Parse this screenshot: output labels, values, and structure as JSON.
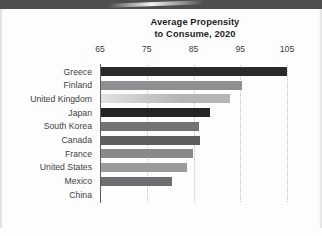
{
  "chart_data": {
    "type": "bar",
    "orientation": "horizontal",
    "title": "Average Propensity to Consume, 2020",
    "title_line1": "Average Propensity",
    "title_line2": "to Consume, 2020",
    "xlabel": "",
    "ylabel": "",
    "xlim": [
      65,
      105
    ],
    "xticks": [
      65,
      75,
      85,
      95,
      105
    ],
    "xtick_labels": [
      "65",
      "75",
      "85",
      "95",
      "105"
    ],
    "grid": "dotted vertical gridlines at each x tick",
    "legend": "none",
    "categories": [
      "Greece",
      "Finland",
      "United Kingdom",
      "Japan",
      "South Korea",
      "Canada",
      "France",
      "United States",
      "Mexico",
      "China"
    ],
    "values": [
      105.0,
      95.3,
      92.8,
      88.5,
      86.1,
      86.3,
      84.9,
      83.7,
      80.3,
      65.3
    ],
    "bar_colors": [
      "#2a2a2c",
      "#8f8f91",
      "#b4b4b6",
      "#242426",
      "#737375",
      "#5f5f61",
      "#8a8a8c",
      "#9a9a9c",
      "#6e6e70",
      "#59595b"
    ]
  },
  "page": {
    "background": "#fdfdfd",
    "top_band_color": "#4e4e50",
    "rule_color": "#8d8d8d"
  }
}
